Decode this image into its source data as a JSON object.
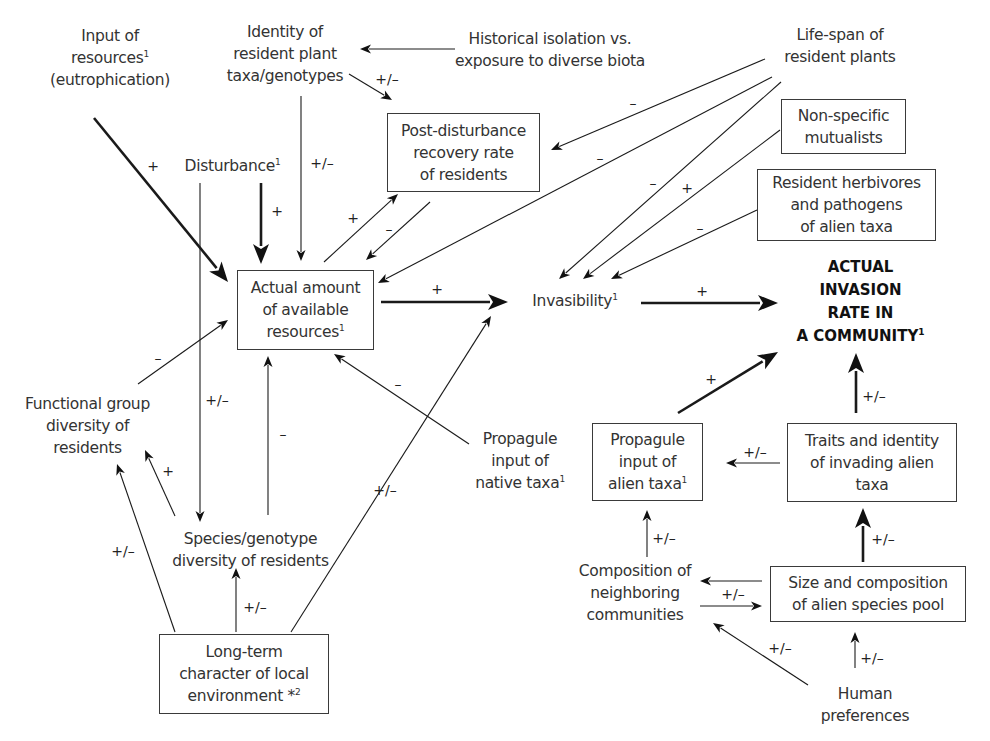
{
  "diagram": {
    "nodes": [
      {
        "id": "input_resources",
        "lines": [
          "Input of",
          "resources¹",
          "(eutrophication)"
        ],
        "boxed": false,
        "x": 40,
        "y": 8,
        "w": 140,
        "h": 100
      },
      {
        "id": "identity_resident",
        "lines": [
          "Identity of",
          "resident plant",
          "taxa/genotypes"
        ],
        "boxed": false,
        "x": 215,
        "y": 16,
        "w": 140,
        "h": 76
      },
      {
        "id": "historical_isolation",
        "lines": [
          "Historical isolation vs.",
          "exposure to diverse biota"
        ],
        "boxed": false,
        "x": 450,
        "y": 24,
        "w": 200,
        "h": 52
      },
      {
        "id": "life_span",
        "lines": [
          "Life-span of",
          "resident plants"
        ],
        "boxed": false,
        "x": 770,
        "y": 20,
        "w": 140,
        "h": 52
      },
      {
        "id": "disturbance",
        "lines": [
          "Disturbance¹"
        ],
        "boxed": false,
        "x": 175,
        "y": 152,
        "w": 115,
        "h": 28
      },
      {
        "id": "post_disturbance",
        "lines": [
          "Post-disturbance",
          "recovery rate",
          "of residents"
        ],
        "boxed": true,
        "x": 387,
        "y": 113,
        "w": 153,
        "h": 79
      },
      {
        "id": "non_specific",
        "lines": [
          "Non-specific",
          "mutualists"
        ],
        "boxed": true,
        "x": 781,
        "y": 99,
        "w": 125,
        "h": 55
      },
      {
        "id": "resident_herbivores",
        "lines": [
          "Resident herbivores",
          "and pathogens",
          "of alien taxa"
        ],
        "boxed": true,
        "x": 757,
        "y": 169,
        "w": 179,
        "h": 72
      },
      {
        "id": "actual_resources",
        "lines": [
          "Actual amount",
          "of available",
          "resources¹"
        ],
        "boxed": true,
        "x": 237,
        "y": 270,
        "w": 137,
        "h": 80
      },
      {
        "id": "invasibility",
        "lines": [
          "Invasibility¹"
        ],
        "boxed": false,
        "x": 520,
        "y": 287,
        "w": 110,
        "h": 28
      },
      {
        "id": "invasion_rate",
        "lines": [
          "ACTUAL",
          "INVASION",
          "RATE IN",
          "A COMMUNITY¹"
        ],
        "boxed": false,
        "bold": true,
        "x": 778,
        "y": 254,
        "w": 165,
        "h": 96
      },
      {
        "id": "functional_group",
        "lines": [
          "Functional group",
          "diversity of",
          "residents"
        ],
        "boxed": false,
        "x": 15,
        "y": 390,
        "w": 145,
        "h": 72
      },
      {
        "id": "propagule_native",
        "lines": [
          "Propagule",
          "input of",
          "native taxa¹"
        ],
        "boxed": false,
        "x": 465,
        "y": 425,
        "w": 110,
        "h": 72
      },
      {
        "id": "propagule_alien",
        "lines": [
          "Propagule",
          "input of",
          "alien taxa¹"
        ],
        "boxed": true,
        "x": 592,
        "y": 423,
        "w": 111,
        "h": 78
      },
      {
        "id": "traits_identity",
        "lines": [
          "Traits and identity",
          "of invading alien",
          "taxa"
        ],
        "boxed": true,
        "x": 787,
        "y": 423,
        "w": 170,
        "h": 79
      },
      {
        "id": "species_genotype",
        "lines": [
          "Species/genotype",
          "diversity of residents"
        ],
        "boxed": false,
        "x": 158,
        "y": 525,
        "w": 185,
        "h": 50
      },
      {
        "id": "composition_neighbor",
        "lines": [
          "Composition of",
          "neighboring",
          "communities"
        ],
        "boxed": false,
        "x": 565,
        "y": 557,
        "w": 140,
        "h": 72
      },
      {
        "id": "size_composition",
        "lines": [
          "Size and composition",
          "of alien species pool"
        ],
        "boxed": true,
        "x": 770,
        "y": 566,
        "w": 196,
        "h": 56
      },
      {
        "id": "long_term",
        "lines": [
          "Long-term",
          "character of local",
          "environment *²"
        ],
        "boxed": true,
        "x": 159,
        "y": 634,
        "w": 170,
        "h": 80
      },
      {
        "id": "human_preferences",
        "lines": [
          "Human",
          "preferences"
        ],
        "boxed": false,
        "x": 810,
        "y": 680,
        "w": 110,
        "h": 50
      }
    ],
    "edges": [
      {
        "from": "input_resources",
        "to": "actual_resources",
        "sign": "+",
        "weight": "thick",
        "pts": [
          94,
          118,
          228,
          282
        ],
        "lx": 153,
        "ly": 166
      },
      {
        "from": "disturbance",
        "to": "actual_resources",
        "sign": "+",
        "weight": "thick",
        "pts": [
          261,
          183,
          261,
          264
        ],
        "lx": 277,
        "ly": 211
      },
      {
        "from": "disturbance",
        "to": "species_genotype",
        "sign": "+/-",
        "weight": "thin",
        "pts": [
          200,
          183,
          200,
          522
        ],
        "lx": 217,
        "ly": 400
      },
      {
        "from": "identity_resident",
        "to": "actual_resources",
        "sign": "+/-",
        "weight": "thin",
        "pts": [
          301,
          96,
          301,
          261
        ],
        "lx": 322,
        "ly": 163
      },
      {
        "from": "identity_resident",
        "to": "post_disturbance",
        "sign": "+/-",
        "weight": "thin",
        "pts": [
          349,
          74,
          392,
          100
        ],
        "lx": 387,
        "ly": 79
      },
      {
        "from": "historical_isolation",
        "to": "identity_resident",
        "sign": "",
        "weight": "thin",
        "pts": [
          455,
          49,
          360,
          49
        ],
        "lx": 0,
        "ly": 0
      },
      {
        "from": "actual_resources",
        "to": "post_disturbance",
        "sign": "+",
        "weight": "thin",
        "pts": [
          324,
          262,
          398,
          194
        ],
        "lx": 353,
        "ly": 218
      },
      {
        "from": "post_disturbance",
        "to": "actual_resources",
        "sign": "-",
        "weight": "thin",
        "pts": [
          430,
          202,
          366,
          260
        ],
        "lx": 389,
        "ly": 229
      },
      {
        "from": "life_span",
        "to": "post_disturbance",
        "sign": "-",
        "weight": "thin",
        "pts": [
          765,
          59,
          551,
          150
        ],
        "lx": 633,
        "ly": 103
      },
      {
        "from": "life_span",
        "to": "actual_resources",
        "sign": "-",
        "weight": "thin",
        "pts": [
          772,
          77,
          378,
          283
        ],
        "lx": 600,
        "ly": 158
      },
      {
        "from": "life_span",
        "to": "invasibility",
        "sign": "-",
        "weight": "thin",
        "pts": [
          781,
          82,
          559,
          279
        ],
        "lx": 653,
        "ly": 183
      },
      {
        "from": "non_specific",
        "to": "invasibility",
        "sign": "+",
        "weight": "thin",
        "pts": [
          780,
          130,
          583,
          279
        ],
        "lx": 687,
        "ly": 188
      },
      {
        "from": "resident_herbivores",
        "to": "invasibility",
        "sign": "-",
        "weight": "thin",
        "pts": [
          757,
          210,
          611,
          279
        ],
        "lx": 700,
        "ly": 228
      },
      {
        "from": "actual_resources",
        "to": "invasibility",
        "sign": "+",
        "weight": "thick",
        "pts": [
          381,
          302,
          508,
          302
        ],
        "lx": 437,
        "ly": 289
      },
      {
        "from": "invasibility",
        "to": "invasion_rate",
        "sign": "+",
        "weight": "thick",
        "pts": [
          641,
          303,
          778,
          303
        ],
        "lx": 702,
        "ly": 291
      },
      {
        "from": "functional_group",
        "to": "actual_resources",
        "sign": "-",
        "weight": "thin",
        "pts": [
          138,
          384,
          228,
          320
        ],
        "lx": 158,
        "ly": 358
      },
      {
        "from": "species_genotype",
        "to": "actual_resources",
        "sign": "-",
        "weight": "thin",
        "pts": [
          268,
          515,
          268,
          356
        ],
        "lx": 283,
        "ly": 434
      },
      {
        "from": "species_genotype",
        "to": "functional_group",
        "sign": "+",
        "weight": "thin",
        "pts": [
          175,
          516,
          145,
          450
        ],
        "lx": 168,
        "ly": 471
      },
      {
        "from": "long_term",
        "to": "functional_group",
        "sign": "+/-",
        "weight": "thin",
        "pts": [
          175,
          632,
          117,
          464
        ],
        "lx": 123,
        "ly": 551
      },
      {
        "from": "long_term",
        "to": "species_genotype",
        "sign": "+/-",
        "weight": "thin",
        "pts": [
          236,
          632,
          236,
          568
        ],
        "lx": 255,
        "ly": 607
      },
      {
        "from": "long_term",
        "to": "invasibility",
        "sign": "+/-",
        "weight": "thin",
        "pts": [
          291,
          632,
          491,
          316
        ],
        "lx": 385,
        "ly": 490
      },
      {
        "from": "propagule_native",
        "to": "actual_resources",
        "sign": "-",
        "weight": "thin",
        "pts": [
          469,
          444,
          334,
          354
        ],
        "lx": 398,
        "ly": 384
      },
      {
        "from": "propagule_alien",
        "to": "invasion_rate",
        "sign": "+",
        "weight": "thick",
        "pts": [
          678,
          413,
          778,
          352
        ],
        "lx": 711,
        "ly": 379
      },
      {
        "from": "traits_identity",
        "to": "invasion_rate",
        "sign": "+/-",
        "weight": "thick",
        "pts": [
          856,
          413,
          856,
          353
        ],
        "lx": 874,
        "ly": 396
      },
      {
        "from": "traits_identity",
        "to": "propagule_alien",
        "sign": "+/-",
        "weight": "thin",
        "pts": [
          780,
          463,
          726,
          463
        ],
        "lx": 755,
        "ly": 452
      },
      {
        "from": "size_composition",
        "to": "traits_identity",
        "sign": "+/-",
        "weight": "thick",
        "pts": [
          863,
          562,
          863,
          508
        ],
        "lx": 883,
        "ly": 539
      },
      {
        "from": "composition_neighbor",
        "to": "propagule_alien",
        "sign": "+/-",
        "weight": "thin",
        "pts": [
          647,
          557,
          647,
          510
        ],
        "lx": 664,
        "ly": 538
      },
      {
        "from": "size_composition",
        "to": "composition_neighbor",
        "sign": "",
        "weight": "thin",
        "pts": [
          762,
          581,
          700,
          581
        ],
        "lx": 0,
        "ly": 0
      },
      {
        "from": "composition_neighbor",
        "to": "size_composition",
        "sign": "+/-",
        "weight": "thin",
        "pts": [
          700,
          606,
          762,
          606
        ],
        "lx": 733,
        "ly": 594
      },
      {
        "from": "human_preferences",
        "to": "composition_neighbor",
        "sign": "+/-",
        "weight": "thin",
        "pts": [
          808,
          685,
          713,
          623
        ],
        "lx": 780,
        "ly": 648
      },
      {
        "from": "human_preferences",
        "to": "size_composition",
        "sign": "+/-",
        "weight": "thin",
        "pts": [
          855,
          668,
          855,
          632
        ],
        "lx": 872,
        "ly": 658
      }
    ]
  }
}
